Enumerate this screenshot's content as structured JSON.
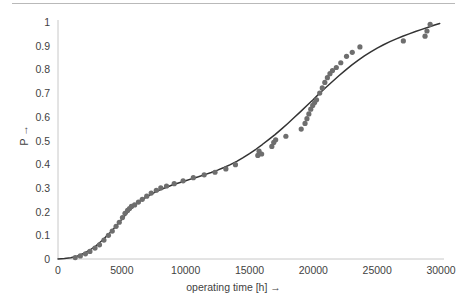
{
  "chart_data": {
    "type": "scatter",
    "title": "",
    "subtitle": "",
    "xlabel": "operating time [h] →",
    "ylabel": "P →",
    "xlim": [
      0,
      30000
    ],
    "ylim": [
      0,
      1
    ],
    "grid": false,
    "legend": null,
    "legend_position": "none",
    "xticks": [
      0,
      5000,
      10000,
      15000,
      20000,
      25000,
      30000
    ],
    "xticklabels": [
      "0",
      "5000",
      "10000",
      "15000",
      "20000",
      "25000",
      "30000"
    ],
    "yticks": [
      0,
      0.1,
      0.2,
      0.3,
      0.4,
      0.5,
      0.6,
      0.7,
      0.8,
      0.9,
      1
    ],
    "yticklabels": [
      "0",
      "0.1",
      "0.2",
      "0.3",
      "0.4",
      "0.5",
      "0.6",
      "0.7",
      "0.8",
      "0.9",
      "1"
    ],
    "marker_color": "#6e6e6e",
    "line_color": "#333333",
    "axis_color": "#c8c8c8",
    "series": [
      {
        "name": "measured failure probability",
        "type": "scatter",
        "marker": "circle",
        "points": [
          [
            1350,
            0.006
          ],
          [
            1750,
            0.013
          ],
          [
            2150,
            0.022
          ],
          [
            2500,
            0.032
          ],
          [
            2900,
            0.046
          ],
          [
            3250,
            0.06
          ],
          [
            3600,
            0.08
          ],
          [
            3950,
            0.1
          ],
          [
            4250,
            0.118
          ],
          [
            4550,
            0.138
          ],
          [
            4800,
            0.155
          ],
          [
            5050,
            0.175
          ],
          [
            5250,
            0.193
          ],
          [
            5450,
            0.205
          ],
          [
            5600,
            0.213
          ],
          [
            5750,
            0.222
          ],
          [
            6000,
            0.228
          ],
          [
            6300,
            0.24
          ],
          [
            6600,
            0.252
          ],
          [
            6950,
            0.265
          ],
          [
            7300,
            0.278
          ],
          [
            7700,
            0.29
          ],
          [
            8050,
            0.3
          ],
          [
            8500,
            0.308
          ],
          [
            9100,
            0.318
          ],
          [
            9800,
            0.33
          ],
          [
            10600,
            0.343
          ],
          [
            11450,
            0.355
          ],
          [
            12300,
            0.366
          ],
          [
            13150,
            0.38
          ],
          [
            13900,
            0.398
          ],
          [
            15650,
            0.437
          ],
          [
            15750,
            0.455
          ],
          [
            15950,
            0.443
          ],
          [
            16750,
            0.475
          ],
          [
            16900,
            0.492
          ],
          [
            17050,
            0.503
          ],
          [
            17850,
            0.518
          ],
          [
            19050,
            0.548
          ],
          [
            19350,
            0.572
          ],
          [
            19500,
            0.592
          ],
          [
            19650,
            0.612
          ],
          [
            19800,
            0.632
          ],
          [
            19950,
            0.648
          ],
          [
            20100,
            0.66
          ],
          [
            20250,
            0.672
          ],
          [
            20500,
            0.7
          ],
          [
            20700,
            0.722
          ],
          [
            20900,
            0.745
          ],
          [
            21100,
            0.765
          ],
          [
            21300,
            0.782
          ],
          [
            21500,
            0.795
          ],
          [
            21800,
            0.808
          ],
          [
            22150,
            0.828
          ],
          [
            22600,
            0.855
          ],
          [
            23050,
            0.872
          ],
          [
            23650,
            0.895
          ],
          [
            27050,
            0.92
          ],
          [
            28750,
            0.94
          ],
          [
            28900,
            0.962
          ],
          [
            29150,
            0.99
          ]
        ]
      },
      {
        "name": "fitted distribution",
        "type": "line",
        "points": [
          [
            0,
            0.0
          ],
          [
            500,
            0.002
          ],
          [
            1000,
            0.005
          ],
          [
            1500,
            0.012
          ],
          [
            2000,
            0.023
          ],
          [
            2500,
            0.038
          ],
          [
            3000,
            0.057
          ],
          [
            3500,
            0.08
          ],
          [
            4000,
            0.107
          ],
          [
            4500,
            0.136
          ],
          [
            5000,
            0.168
          ],
          [
            5500,
            0.199
          ],
          [
            6000,
            0.226
          ],
          [
            6500,
            0.247
          ],
          [
            7000,
            0.264
          ],
          [
            7500,
            0.279
          ],
          [
            8000,
            0.292
          ],
          [
            8500,
            0.303
          ],
          [
            9000,
            0.313
          ],
          [
            9500,
            0.322
          ],
          [
            10000,
            0.33
          ],
          [
            10500,
            0.339
          ],
          [
            11000,
            0.347
          ],
          [
            11500,
            0.356
          ],
          [
            12000,
            0.365
          ],
          [
            12500,
            0.375
          ],
          [
            13000,
            0.386
          ],
          [
            13500,
            0.398
          ],
          [
            14000,
            0.412
          ],
          [
            14500,
            0.428
          ],
          [
            15000,
            0.445
          ],
          [
            15500,
            0.463
          ],
          [
            16000,
            0.483
          ],
          [
            16500,
            0.504
          ],
          [
            17000,
            0.525
          ],
          [
            17500,
            0.548
          ],
          [
            18000,
            0.572
          ],
          [
            18500,
            0.597
          ],
          [
            19000,
            0.622
          ],
          [
            19500,
            0.648
          ],
          [
            20000,
            0.673
          ],
          [
            20500,
            0.7
          ],
          [
            21000,
            0.725
          ],
          [
            21500,
            0.749
          ],
          [
            22000,
            0.773
          ],
          [
            22500,
            0.796
          ],
          [
            23000,
            0.818
          ],
          [
            23500,
            0.838
          ],
          [
            24000,
            0.857
          ],
          [
            24500,
            0.874
          ],
          [
            25000,
            0.89
          ],
          [
            25500,
            0.904
          ],
          [
            26000,
            0.917
          ],
          [
            26500,
            0.929
          ],
          [
            27000,
            0.94
          ],
          [
            27500,
            0.95
          ],
          [
            28000,
            0.96
          ],
          [
            28500,
            0.969
          ],
          [
            29000,
            0.978
          ],
          [
            29500,
            0.987
          ],
          [
            29900,
            0.994
          ]
        ]
      }
    ]
  }
}
